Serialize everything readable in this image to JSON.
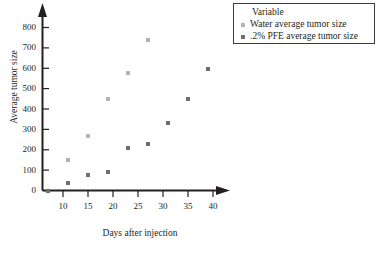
{
  "chart_data": {
    "type": "scatter",
    "title": "",
    "xlabel": "Days after injection",
    "ylabel": "Average tumor size",
    "xlim": [
      5,
      42
    ],
    "ylim": [
      0,
      800
    ],
    "xticks": [
      10,
      15,
      20,
      25,
      30,
      35,
      40
    ],
    "yticks": [
      0,
      100,
      200,
      300,
      400,
      500,
      600,
      700,
      800
    ],
    "grid": false,
    "legend_position": "top-right",
    "legend_title": "Variable",
    "series": [
      {
        "name": "Water average tumor size",
        "marker": "square",
        "color": "#b3b3b3",
        "points": [
          {
            "x": 11,
            "y": 150
          },
          {
            "x": 15,
            "y": 267
          },
          {
            "x": 19,
            "y": 447
          },
          {
            "x": 23,
            "y": 577
          },
          {
            "x": 27,
            "y": 737
          }
        ]
      },
      {
        "name": ".2% PFE average tumor size",
        "marker": "square",
        "color": "#6e6e6e",
        "points": [
          {
            "x": 7,
            "y": 0
          },
          {
            "x": 11,
            "y": 38
          },
          {
            "x": 15,
            "y": 75
          },
          {
            "x": 19,
            "y": 90
          },
          {
            "x": 23,
            "y": 210
          },
          {
            "x": 27,
            "y": 227
          },
          {
            "x": 31,
            "y": 330
          },
          {
            "x": 35,
            "y": 447
          },
          {
            "x": 39,
            "y": 597
          }
        ]
      }
    ]
  },
  "axis": {
    "y_tick_labels": [
      "800",
      "700",
      "600",
      "500",
      "400",
      "300",
      "200",
      "100",
      "0"
    ],
    "x_tick_labels": [
      "10",
      "15",
      "20",
      "25",
      "30",
      "35",
      "40"
    ],
    "y_title": "Average tumor size",
    "x_title": "Days after injection"
  },
  "legend": {
    "title": "Variable",
    "entries": [
      {
        "label": "Water average tumor size",
        "swatch": "legend-swatch-water"
      },
      {
        "label": ".2% PFE average tumor size",
        "swatch": "legend-swatch-pfe"
      }
    ]
  },
  "colors": {
    "water": "#b3b3b3",
    "pfe": "#6e6e6e",
    "axis": "#231f20",
    "legend_border": "#3a3a3a"
  }
}
